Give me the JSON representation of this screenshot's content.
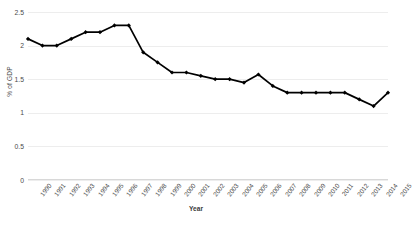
{
  "chart_data": {
    "type": "line",
    "title": "",
    "xlabel": "Year",
    "ylabel": "% of GDP",
    "ylim": [
      0,
      2.5
    ],
    "yticks": [
      0,
      0.5,
      1,
      1.5,
      2,
      2.5
    ],
    "ytick_labels": [
      "0",
      "0.5",
      "1",
      "1.5",
      "2",
      "2.5"
    ],
    "grid": true,
    "legend": "none",
    "marker": "diamond",
    "line_color": "#000000",
    "categories": [
      "1990",
      "1991",
      "1992",
      "1993",
      "1994",
      "1995",
      "1996",
      "1997",
      "1998",
      "1999",
      "2000",
      "2001",
      "2002",
      "2003",
      "2004",
      "2005",
      "2006",
      "2007",
      "2008",
      "2009",
      "2010",
      "2011",
      "2012",
      "2013",
      "2014",
      "2015"
    ],
    "values": [
      2.1,
      2.0,
      2.0,
      2.1,
      2.2,
      2.2,
      2.3,
      2.3,
      1.9,
      1.75,
      1.6,
      1.6,
      1.55,
      1.5,
      1.5,
      1.45,
      1.57,
      1.4,
      1.3,
      1.3,
      1.3,
      1.3,
      1.3,
      1.2,
      1.2,
      1.2
    ],
    "series": [
      {
        "name": "% of GDP",
        "values": [
          2.1,
          2.0,
          2.0,
          2.1,
          2.2,
          2.2,
          2.3,
          2.3,
          1.9,
          1.75,
          1.6,
          1.6,
          1.55,
          1.5,
          1.5,
          1.45,
          1.57,
          1.4,
          1.3,
          1.3,
          1.3,
          1.3,
          1.3,
          1.2,
          1.1,
          1.3
        ]
      }
    ]
  },
  "figure": {
    "caption": ""
  }
}
